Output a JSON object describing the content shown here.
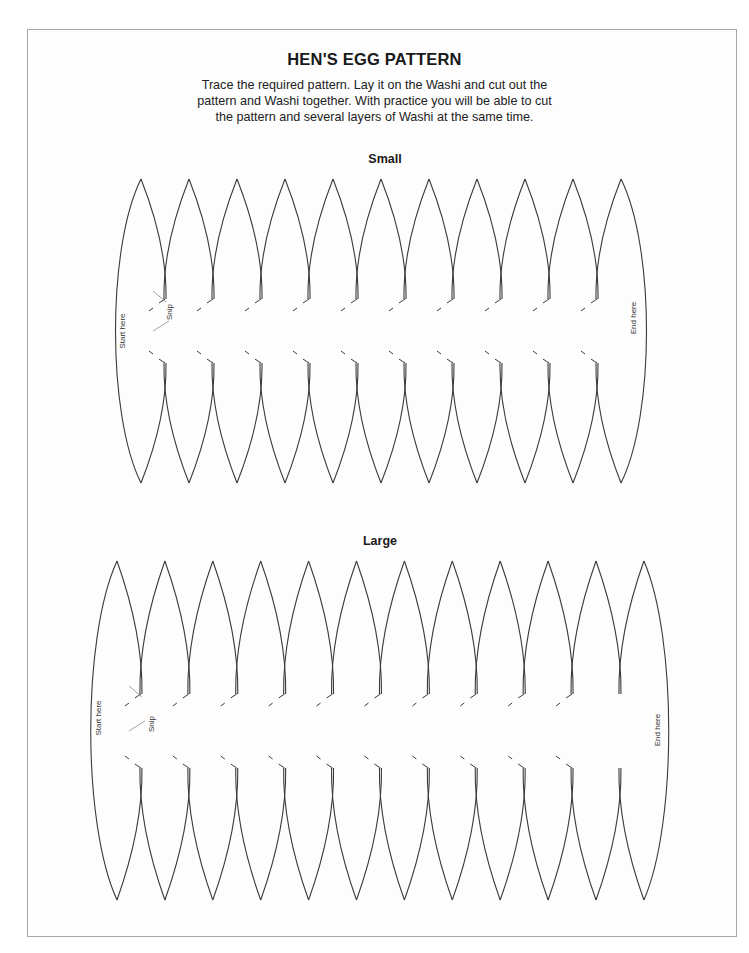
{
  "page": {
    "title": "HEN'S EGG PATTERN",
    "instructions": [
      "Trace the required pattern. Lay it on the Washi and cut out the",
      "pattern and Washi together. With practice you will be able to cut",
      "the pattern and several layers of Washi at the same time."
    ]
  },
  "patterns": [
    {
      "label": "Small",
      "label_pos": {
        "x": 385,
        "y": 152
      },
      "petal_count": 11,
      "first_apex_x": 141,
      "apex_step": 48,
      "top_y": 179,
      "bottom_y": 483,
      "center_y": 331,
      "left_edge_x": 113,
      "right_edge_x": 649,
      "notch_half": 32,
      "snip_last_valley": true,
      "start_label": "Start here",
      "end_label": "End here",
      "snip_label": "Snip",
      "start_label_pos": {
        "x": 125,
        "y": 331
      },
      "end_label_pos": {
        "x": 636,
        "y": 318
      },
      "snip_label_pos": {
        "x": 172,
        "y": 312
      }
    },
    {
      "label": "Large",
      "label_pos": {
        "x": 380,
        "y": 534
      },
      "petal_count": 12,
      "first_apex_x": 117,
      "apex_step": 47.9,
      "top_y": 561,
      "bottom_y": 900,
      "center_y": 731,
      "left_edge_x": 88,
      "right_edge_x": 671,
      "notch_half": 37,
      "snip_last_valley": false,
      "start_label": "Start here",
      "end_label": "End here",
      "snip_label": "Snip",
      "start_label_pos": {
        "x": 101,
        "y": 718
      },
      "end_label_pos": {
        "x": 660,
        "y": 730
      },
      "snip_label_pos": {
        "x": 154,
        "y": 724
      }
    }
  ],
  "colors": {
    "line": "#3a3a3a",
    "leader": "#8a8a8a",
    "frame": "#a8a8a8"
  }
}
